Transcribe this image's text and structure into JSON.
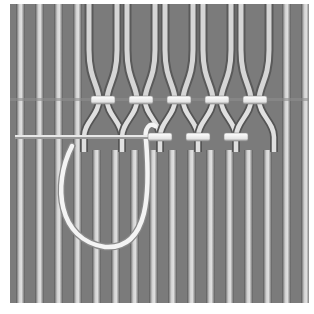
{
  "illustration": {
    "subject": "hemstitch-embroidery-diagram",
    "frame": {
      "x": 10,
      "y": 4,
      "width": 299,
      "height": 299
    },
    "colors": {
      "background": "#ffffff",
      "fabric": "#7b7b7b",
      "thread_light": "#d9d9d9",
      "thread_dark": "#4a4a4a",
      "stitch": "#f2f2f2",
      "stitch_shadow": "#9a9a9a"
    },
    "thread_spacing": 19,
    "upper_row_y": 100,
    "lower_row_y": 137,
    "upper_wraps_x": [
      103,
      141,
      179,
      217,
      255
    ],
    "lower_wraps_x": [
      160,
      198,
      236
    ],
    "needle": {
      "x1": 15,
      "y1": 137,
      "x2": 165,
      "y2": 137
    }
  }
}
